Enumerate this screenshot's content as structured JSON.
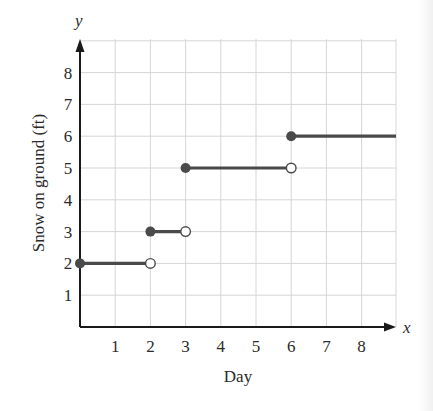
{
  "chart_data": {
    "type": "line",
    "subtype": "step_function",
    "title": "",
    "xlabel": "Day",
    "ylabel": "Snow on ground (ft)",
    "x_axis_var": "x",
    "y_axis_var": "y",
    "xlim": [
      0,
      9
    ],
    "ylim": [
      0,
      9
    ],
    "x_ticks": [
      1,
      2,
      3,
      4,
      5,
      6,
      7,
      8
    ],
    "y_ticks": [
      1,
      2,
      3,
      4,
      5,
      6,
      7,
      8
    ],
    "grid": true,
    "legend": null,
    "segments": [
      {
        "x_start": 0,
        "x_end": 2,
        "y": 2,
        "start_closed": true,
        "end_closed": false
      },
      {
        "x_start": 2,
        "x_end": 3,
        "y": 3,
        "start_closed": true,
        "end_closed": false
      },
      {
        "x_start": 3,
        "x_end": 6,
        "y": 5,
        "start_closed": true,
        "end_closed": false
      },
      {
        "x_start": 6,
        "x_end": 9,
        "y": 6,
        "start_closed": true,
        "end_closed": null
      }
    ],
    "colors": {
      "line": "#4a4a4a",
      "axis": "#1a1a1a",
      "grid": "#d6d6d6"
    }
  },
  "labels": {
    "x_var": "x",
    "y_var": "y",
    "xlabel": "Day",
    "ylabel": "Snow on ground (ft)",
    "x_ticks": [
      "1",
      "2",
      "3",
      "4",
      "5",
      "6",
      "7",
      "8"
    ],
    "y_ticks": [
      "1",
      "2",
      "3",
      "4",
      "5",
      "6",
      "7",
      "8"
    ]
  }
}
